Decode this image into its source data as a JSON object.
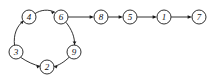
{
  "diagram": {
    "type": "directed-graph",
    "width": 214,
    "height": 83,
    "background_color": "#ffffff",
    "stroke_color": "#1a1a1a",
    "label_color": "#111111",
    "node_radius": 7,
    "nodes": [
      {
        "id": "4",
        "label": "4",
        "cx": 29,
        "cy": 17
      },
      {
        "id": "6",
        "label": "6",
        "cx": 61,
        "cy": 17
      },
      {
        "id": "8",
        "label": "8",
        "cx": 101,
        "cy": 17
      },
      {
        "id": "5",
        "label": "5",
        "cx": 130,
        "cy": 17
      },
      {
        "id": "1",
        "label": "1",
        "cx": 164,
        "cy": 17
      },
      {
        "id": "7",
        "label": "7",
        "cx": 199,
        "cy": 17
      },
      {
        "id": "3",
        "label": "3",
        "cx": 16,
        "cy": 52
      },
      {
        "id": "9",
        "label": "9",
        "cx": 74,
        "cy": 52
      },
      {
        "id": "2",
        "label": "2",
        "cx": 47,
        "cy": 67
      }
    ],
    "edges": [
      {
        "from": "3",
        "to": "4",
        "shape": "curved"
      },
      {
        "from": "4",
        "to": "6",
        "shape": "curved"
      },
      {
        "from": "6",
        "to": "9",
        "shape": "curved"
      },
      {
        "from": "9",
        "to": "2",
        "shape": "curved"
      },
      {
        "from": "3",
        "to": "2",
        "shape": "curved"
      },
      {
        "from": "6",
        "to": "8",
        "shape": "straight"
      },
      {
        "from": "8",
        "to": "5",
        "shape": "straight"
      },
      {
        "from": "5",
        "to": "1",
        "shape": "straight"
      },
      {
        "from": "1",
        "to": "7",
        "shape": "straight"
      }
    ]
  }
}
